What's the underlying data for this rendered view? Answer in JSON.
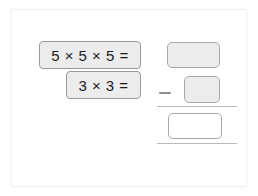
{
  "worksheet": {
    "title": "Multiplication and subtraction worksheet",
    "expressions": [
      {
        "name": "expression-one",
        "text": "5 × 5 × 5 ="
      },
      {
        "name": "expression-two",
        "text": "3 × 3 ="
      }
    ],
    "subtraction": {
      "minuend_box": {
        "value": "",
        "placeholder": "",
        "style": "filled"
      },
      "operator": "−",
      "subtrahend_box": {
        "value": "",
        "placeholder": "",
        "style": "filled"
      },
      "result_box": {
        "value": "",
        "placeholder": "",
        "style": "empty"
      }
    },
    "colors": {
      "chip_fill": "#ececec",
      "chip_border": "#9a9a9a",
      "box_border": "#a8a8a8",
      "rule": "#b9b9b9",
      "page_background": "#ffffff",
      "text": "#1c1c1c"
    }
  }
}
